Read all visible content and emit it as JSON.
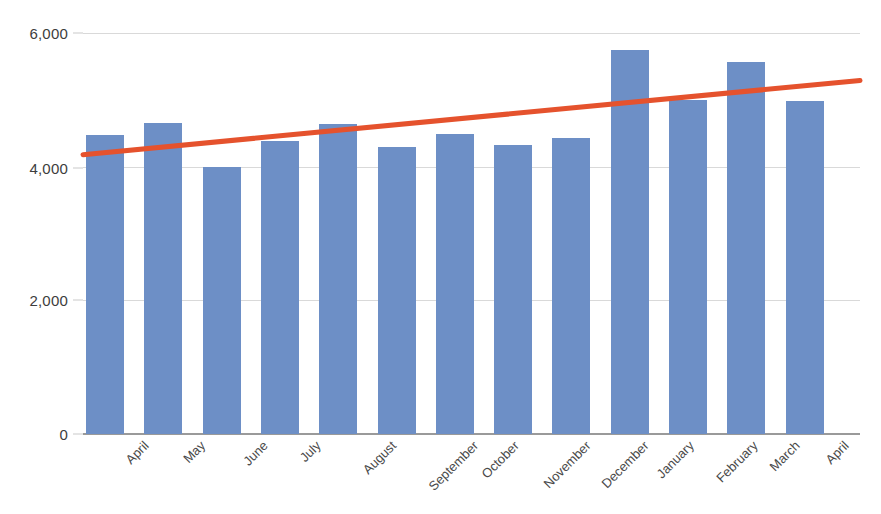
{
  "chart_data": {
    "type": "bar",
    "title": "",
    "subtitle": "",
    "xlabel": "",
    "ylabel": "",
    "categories": [
      "April",
      "May",
      "June",
      "July",
      "August",
      "September",
      "October",
      "November",
      "December",
      "January",
      "February",
      "March",
      "April"
    ],
    "values": [
      4480,
      4650,
      3990,
      4390,
      4640,
      4290,
      4490,
      4320,
      4430,
      5740,
      5000,
      5570,
      4990
    ],
    "series": [
      {
        "name": "Monthly total",
        "type": "bar",
        "color": "#6d8fc6",
        "values": [
          4480,
          4650,
          3990,
          4390,
          4640,
          4290,
          4490,
          4320,
          4430,
          5740,
          5000,
          5570,
          4990
        ]
      },
      {
        "name": "Trendline",
        "type": "line",
        "color": "#e5522d",
        "values": [
          4180,
          4273,
          4365,
          4458,
          4551,
          4643,
          4736,
          4828,
          4921,
          5014,
          5106,
          5199,
          5290
        ],
        "start_value": 4180,
        "end_value": 5290
      }
    ],
    "ylim": [
      0,
      6000
    ],
    "yticks": [
      0,
      2000,
      4000,
      6000
    ],
    "ytick_labels": [
      "0",
      "2,000",
      "4,000",
      "6,000"
    ],
    "grid": true,
    "grid_color": "#d9d9d9",
    "legend": false,
    "legend_position": "none",
    "xtick_rotation": -45,
    "background": "#ffffff",
    "axis_color": "#9a9a9a",
    "annotations": []
  }
}
